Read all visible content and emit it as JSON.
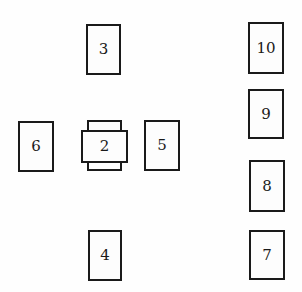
{
  "diagram": {
    "type": "card-spread-layout",
    "colors": {
      "background": "#fefefe",
      "card_border": "#1a1a1a",
      "card_fill": "#fdfdfd",
      "text": "#1a1a1a"
    },
    "cards": [
      {
        "label": "1",
        "x": 87,
        "y": 120,
        "w": 35,
        "h": 51,
        "orientation": "vertical",
        "shows_label": false
      },
      {
        "label": "2",
        "x": 81,
        "y": 130,
        "w": 47,
        "h": 33,
        "orientation": "horizontal",
        "shows_label": true
      },
      {
        "label": "3",
        "x": 86,
        "y": 24,
        "w": 35,
        "h": 51,
        "orientation": "vertical",
        "shows_label": true
      },
      {
        "label": "4",
        "x": 88,
        "y": 230,
        "w": 34,
        "h": 51,
        "orientation": "vertical",
        "shows_label": true
      },
      {
        "label": "5",
        "x": 144,
        "y": 120,
        "w": 36,
        "h": 51,
        "orientation": "vertical",
        "shows_label": true
      },
      {
        "label": "6",
        "x": 18,
        "y": 121,
        "w": 36,
        "h": 51,
        "orientation": "vertical",
        "shows_label": true
      },
      {
        "label": "7",
        "x": 249,
        "y": 230,
        "w": 36,
        "h": 50,
        "orientation": "vertical",
        "shows_label": true
      },
      {
        "label": "8",
        "x": 249,
        "y": 160,
        "w": 36,
        "h": 52,
        "orientation": "vertical",
        "shows_label": true
      },
      {
        "label": "9",
        "x": 248,
        "y": 89,
        "w": 36,
        "h": 50,
        "orientation": "vertical",
        "shows_label": true
      },
      {
        "label": "10",
        "x": 248,
        "y": 22,
        "w": 36,
        "h": 52,
        "orientation": "vertical",
        "shows_label": true
      }
    ]
  }
}
